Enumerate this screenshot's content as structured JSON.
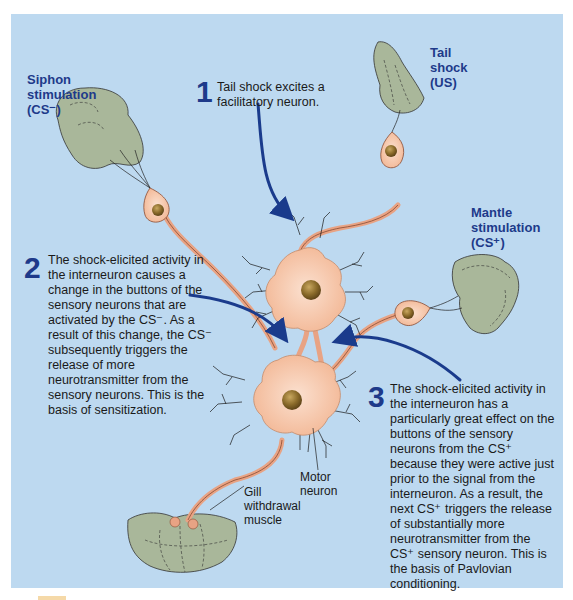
{
  "labels": {
    "siphon": {
      "line1": "Siphon",
      "line2": "stimulation",
      "line3": "(CS⁻)"
    },
    "tail": {
      "line1": "Tail",
      "line2": "shock",
      "line3": "(US)"
    },
    "mantle": {
      "line1": "Mantle",
      "line2": "stimulation",
      "line3": "(CS⁺)"
    },
    "motor_neuron": {
      "line1": "Motor",
      "line2": "neuron"
    },
    "gill": {
      "line1": "Gill",
      "line2": "withdrawal",
      "line3": "muscle"
    }
  },
  "steps": [
    {
      "number": "1",
      "lines": [
        "Tail shock excites a",
        "facilitatory neuron."
      ]
    },
    {
      "number": "2",
      "lines": [
        "The shock-elicited activity in",
        "the interneuron causes a",
        "change in the buttons of the",
        "sensory neurons that are",
        "activated by the CS⁻. As a",
        "result of this change, the CS⁻",
        "subsequently triggers the",
        "release of more",
        "neurotransmitter from the",
        "sensory neurons. This is the",
        "basis of sensitization."
      ]
    },
    {
      "number": "3",
      "lines": [
        "The shock-elicited activity in",
        "the interneuron has a",
        "particularly great effect on the",
        "buttons of the sensory",
        "neurons from the CS⁺",
        "because they were active just",
        "prior to the signal from the",
        "interneuron. As a result, the",
        "next CS⁺ triggers the release",
        "of substantially more",
        "neurotransmitter from the",
        "CS⁺ sensory neuron. This is",
        "the basis of Pavlovian",
        "conditioning."
      ]
    }
  ],
  "colors": {
    "panel_bg": "#bdd9f0",
    "label_blue": "#1e3a8a",
    "arrow_blue": "#1a3b8c",
    "neuron_fill": "#f6c4a8",
    "neuron_stroke": "#8a4a30",
    "nucleus": "#8a6a2a",
    "tissue": "#a9b79a"
  }
}
